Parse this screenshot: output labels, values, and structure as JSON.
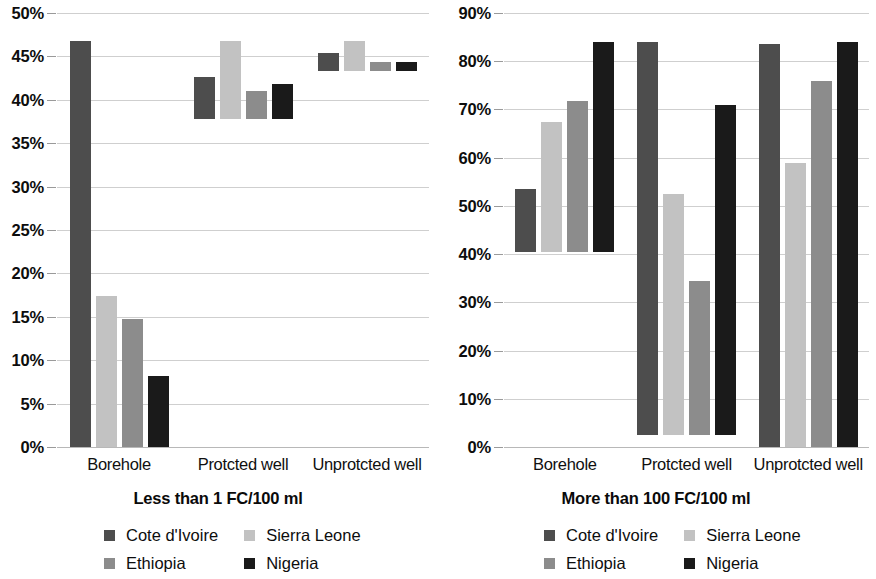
{
  "chart_data": [
    {
      "type": "bar",
      "title": "Less than 1 FC/100 ml",
      "panel": "left",
      "xlabel": "",
      "ylabel": "",
      "ylim": [
        0,
        50
      ],
      "ytick_step": 5,
      "grid": true,
      "legend_position": "bottom",
      "categories": [
        "Borehole",
        "Protcted well",
        "Unprotcted well"
      ],
      "ytick_labels": [
        "0%",
        "5%",
        "10%",
        "15%",
        "20%",
        "25%",
        "30%",
        "35%",
        "40%",
        "45%",
        "50%"
      ],
      "series": [
        {
          "name": "Cote d'Ivoire",
          "color": "#4d4d4d",
          "values": [
            46.8,
            4.8,
            2.1
          ]
        },
        {
          "name": "Sierra Leone",
          "color": "#c2c2c2",
          "values": [
            17.4,
            9.0,
            3.5
          ]
        },
        {
          "name": "Ethiopia",
          "color": "#8c8c8c",
          "values": [
            14.8,
            3.2,
            1.0
          ]
        },
        {
          "name": "Nigeria",
          "color": "#1a1a1a",
          "values": [
            8.2,
            4.0,
            1.0
          ]
        }
      ]
    },
    {
      "type": "bar",
      "title": "More than 100 FC/100 ml",
      "panel": "right",
      "xlabel": "",
      "ylabel": "",
      "ylim": [
        0,
        90
      ],
      "ytick_step": 10,
      "grid": true,
      "legend_position": "bottom",
      "categories": [
        "Borehole",
        "Protcted well",
        "Unprotcted well"
      ],
      "ytick_labels": [
        "0%",
        "10%",
        "20%",
        "30%",
        "40%",
        "50%",
        "60%",
        "70%",
        "80%",
        "90%"
      ],
      "series": [
        {
          "name": "Cote d'Ivoire",
          "color": "#4d4d4d",
          "values": [
            13.0,
            81.5,
            83.5
          ]
        },
        {
          "name": "Sierra Leone",
          "color": "#c2c2c2",
          "values": [
            27.0,
            50.0,
            59.0
          ]
        },
        {
          "name": "Ethiopia",
          "color": "#8c8c8c",
          "values": [
            31.2,
            32.0,
            76.0
          ]
        },
        {
          "name": "Nigeria",
          "color": "#1a1a1a",
          "values": [
            43.5,
            68.5,
            84.0
          ]
        }
      ]
    }
  ],
  "left_chart": {
    "caption": "Less than 1 FC/100 ml",
    "categories": [
      "Borehole",
      "Protcted well",
      "Unprotcted well"
    ],
    "ytick_labels": [
      "50%",
      "45%",
      "40%",
      "35%",
      "30%",
      "25%",
      "20%",
      "15%",
      "10%",
      "5%",
      "0%"
    ],
    "legend": [
      {
        "label": "Cote d'Ivoire",
        "color": "#4d4d4d"
      },
      {
        "label": "Sierra Leone",
        "color": "#c2c2c2"
      },
      {
        "label": "Ethiopia",
        "color": "#8c8c8c"
      },
      {
        "label": "Nigeria",
        "color": "#1a1a1a"
      }
    ]
  },
  "right_chart": {
    "caption": "More than 100 FC/100 ml",
    "categories": [
      "Borehole",
      "Protcted well",
      "Unprotcted well"
    ],
    "ytick_labels": [
      "90%",
      "80%",
      "70%",
      "60%",
      "50%",
      "40%",
      "30%",
      "20%",
      "10%",
      "0%"
    ],
    "legend": [
      {
        "label": "Cote d'Ivoire",
        "color": "#4d4d4d"
      },
      {
        "label": "Sierra Leone",
        "color": "#c2c2c2"
      },
      {
        "label": "Ethiopia",
        "color": "#8c8c8c"
      },
      {
        "label": "Nigeria",
        "color": "#1a1a1a"
      }
    ]
  }
}
